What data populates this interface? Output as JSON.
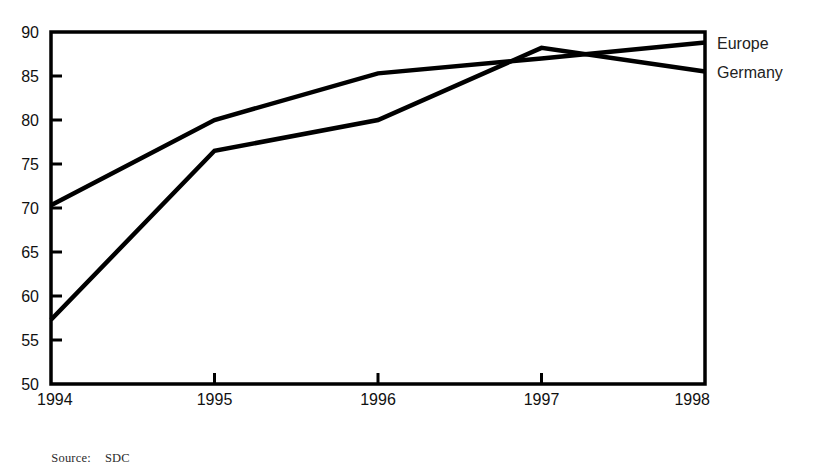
{
  "source_note": {
    "label": "Source:",
    "value": "SDC"
  },
  "chart_data": {
    "type": "line",
    "title": "",
    "subtitle": "",
    "xlabel": "",
    "ylabel": "",
    "categories": [
      "1994",
      "1995",
      "1996",
      "1997",
      "1998"
    ],
    "x": [
      1994,
      1995,
      1996,
      1997,
      1998
    ],
    "xlim": [
      1994,
      1998
    ],
    "ylim": [
      50,
      90
    ],
    "yticks": [
      50,
      55,
      60,
      65,
      70,
      75,
      80,
      85,
      90
    ],
    "ytick_labels": [
      "50",
      "55",
      "60",
      "65",
      "70",
      "75",
      "80",
      "85",
      "90"
    ],
    "xticks": [
      1994,
      1995,
      1996,
      1997,
      1998
    ],
    "xtick_labels": [
      "1994",
      "1995",
      "1996",
      "1997",
      "1998"
    ],
    "grid": false,
    "legend_position": "right-inline",
    "series": [
      {
        "name": "Europe",
        "color": "#000000",
        "values": [
          70.3,
          80.0,
          85.3,
          87.0,
          88.8
        ]
      },
      {
        "name": "Germany",
        "color": "#000000",
        "values": [
          57.3,
          76.5,
          80.0,
          88.2,
          85.5
        ]
      }
    ],
    "annotations": [
      {
        "text": "Europe",
        "series": "Europe",
        "x": 1998,
        "y": 88.8
      },
      {
        "text": "Germany",
        "series": "Germany",
        "x": 1998,
        "y": 85.5
      }
    ]
  }
}
